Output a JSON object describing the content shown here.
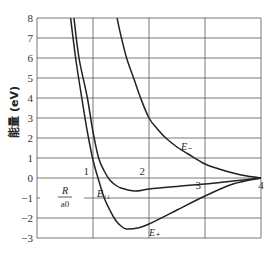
{
  "chart_data": {
    "type": "line",
    "title": "",
    "xlabel": "R/a0",
    "ylabel": "能量 (eV)",
    "xlim": [
      0,
      4
    ],
    "ylim": [
      -3,
      8
    ],
    "grid": true,
    "x_ticks": [
      "1",
      "2",
      "3",
      "4"
    ],
    "y_ticks": [
      "8",
      "7",
      "6",
      "5",
      "4",
      "3",
      "2",
      "1",
      "0",
      "-1",
      "-2",
      "-3"
    ],
    "series": [
      {
        "name": "E+",
        "label": "E₊",
        "points": [
          [
            0.6,
            8
          ],
          [
            0.7,
            5.8
          ],
          [
            0.8,
            4
          ],
          [
            0.9,
            2.3
          ],
          [
            1.0,
            0.9
          ],
          [
            1.1,
            -0.1
          ],
          [
            1.2,
            -1
          ],
          [
            1.3,
            -1.6
          ],
          [
            1.4,
            -2.1
          ],
          [
            1.5,
            -2.4
          ],
          [
            1.6,
            -2.55
          ],
          [
            1.8,
            -2.5
          ],
          [
            2.0,
            -2.3
          ],
          [
            2.5,
            -1.6
          ],
          [
            3.0,
            -0.9
          ],
          [
            3.5,
            -0.3
          ],
          [
            4.0,
            0
          ]
        ]
      },
      {
        "name": "E11",
        "label": "E₁₁",
        "points": [
          [
            0.66,
            8
          ],
          [
            0.75,
            6
          ],
          [
            0.9,
            4
          ],
          [
            1.0,
            2.3
          ],
          [
            1.1,
            1
          ],
          [
            1.2,
            0.35
          ],
          [
            1.3,
            -0.1
          ],
          [
            1.4,
            -0.35
          ],
          [
            1.5,
            -0.5
          ],
          [
            1.75,
            -0.65
          ],
          [
            2.0,
            -0.55
          ],
          [
            2.5,
            -0.42
          ],
          [
            3.0,
            -0.3
          ],
          [
            3.5,
            -0.15
          ],
          [
            4.0,
            0
          ]
        ]
      },
      {
        "name": "E-",
        "label": "E₋",
        "points": [
          [
            1.43,
            8
          ],
          [
            1.5,
            7.1
          ],
          [
            1.6,
            6
          ],
          [
            1.75,
            4.8
          ],
          [
            1.85,
            4
          ],
          [
            2.0,
            3
          ],
          [
            2.15,
            2.45
          ],
          [
            2.3,
            2
          ],
          [
            2.5,
            1.55
          ],
          [
            2.7,
            1.2
          ],
          [
            3.0,
            0.7
          ],
          [
            3.25,
            0.45
          ],
          [
            3.5,
            0.25
          ],
          [
            3.75,
            0.1
          ],
          [
            4.0,
            0
          ]
        ]
      }
    ],
    "annotations": [
      "E₋",
      "E₁₁",
      "E₊",
      "R/a0"
    ]
  },
  "labels": {
    "y_axis": "能量 (eV)",
    "x_axis_num": "R",
    "x_axis_den": "a0",
    "e_minus": "E₋",
    "e_plus": "E₊",
    "e_11": "E₁₁"
  },
  "colors": {
    "grid": "#555555",
    "curve": "#222222"
  }
}
